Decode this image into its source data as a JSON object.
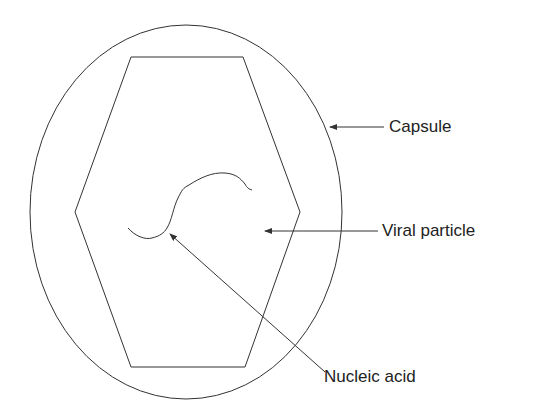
{
  "diagram": {
    "labels": {
      "capsule": "Capsule",
      "viral_particle": "Viral particle",
      "nucleic_acid": "Nucleic acid"
    },
    "colors": {
      "stroke": "#333333",
      "text": "#222222",
      "background": "#ffffff"
    }
  }
}
